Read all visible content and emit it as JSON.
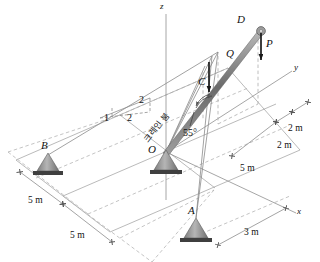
{
  "figure": {
    "type": "engineering-statics-3d-crane-diagram"
  },
  "axes": {
    "z_label": "z",
    "y_label": "y",
    "x_label": "x"
  },
  "points": {
    "O": "O",
    "A": "A",
    "B": "B",
    "C": "C",
    "D": "D",
    "Q": "Q"
  },
  "load": {
    "P": "P"
  },
  "annotations": {
    "boom_label": "크레인 붐",
    "angle": "55°",
    "slope_run": "1",
    "slope_mid": "2",
    "slope_rise": "2"
  },
  "dimensions": {
    "left_5m": "5 m",
    "lower_5m": "5 m",
    "right_5m": "5 m",
    "upper_2m": "2 m",
    "lower_2m": "2 m",
    "bottom_3m": "3 m"
  },
  "colors": {
    "line": "#8a8a8a",
    "dashed": "#a8a8a8",
    "boom": "#6e6e6e",
    "support_fill": "#9a9a9a",
    "support_base": "#4a4a4a",
    "text": "#111111",
    "arrow": "#1a1a1a"
  }
}
